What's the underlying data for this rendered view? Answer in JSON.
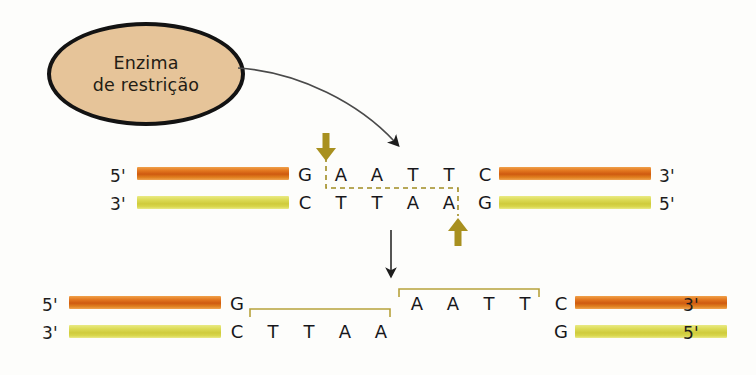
{
  "figure": {
    "background_color": "#fdfdfb"
  },
  "enzyme": {
    "label_line1": "Enzima",
    "label_line2": "de restrição",
    "fill_color": "#e6c499",
    "stroke_color": "#131313"
  },
  "colors": {
    "top_strand": "#d4600f",
    "bottom_strand": "#d6d345",
    "cut_marker": "#a08c22",
    "bracket": "#b7a23c",
    "arrow": "#1d1d1d",
    "text": "#17171a"
  },
  "panel_top": {
    "left_labels": {
      "top": "5'",
      "bottom": "3'"
    },
    "right_labels": {
      "top": "3'",
      "bottom": "5'"
    },
    "top_sequence": [
      "G",
      "A",
      "A",
      "T",
      "T",
      "C"
    ],
    "bottom_sequence": [
      "C",
      "T",
      "T",
      "A",
      "A",
      "G"
    ],
    "cut_arrow_top_label": "cut-site-top",
    "cut_arrow_bottom_label": "cut-site-bottom"
  },
  "panel_bottom": {
    "left_fragment": {
      "left_labels": {
        "top": "5'",
        "bottom": "3'"
      },
      "top_sequence": [
        "G"
      ],
      "bottom_sequence": [
        "C",
        "T",
        "T",
        "A",
        "A"
      ],
      "overhang": [
        "T",
        "T",
        "A",
        "A"
      ]
    },
    "right_fragment": {
      "right_labels": {
        "top": "3'",
        "bottom": "5'"
      },
      "top_sequence": [
        "A",
        "A",
        "T",
        "T",
        "C"
      ],
      "bottom_sequence": [
        "G"
      ],
      "overhang": [
        "A",
        "A",
        "T",
        "T"
      ]
    }
  }
}
